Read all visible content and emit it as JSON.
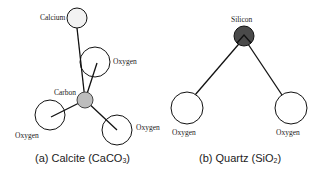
{
  "figure": {
    "panels": [
      {
        "id": "calcite",
        "caption_prefix": "(a) Calcite (CaCO",
        "caption_sub": "3",
        "caption_suffix": ")",
        "atoms": [
          {
            "label": "Calcium",
            "fill": "#f2f2f2"
          },
          {
            "label": "Oxygen",
            "fill": "#ffffff"
          },
          {
            "label": "Carbon",
            "fill": "#bdbdbd"
          },
          {
            "label": "Oxygen",
            "fill": "#ffffff"
          },
          {
            "label": "Oxygen",
            "fill": "#ffffff"
          }
        ]
      },
      {
        "id": "quartz",
        "caption_prefix": "(b) Quartz (SiO",
        "caption_sub": "2",
        "caption_suffix": ")",
        "atoms": [
          {
            "label": "Silicon",
            "fill": "#4a4a4a"
          },
          {
            "label": "Oxygen",
            "fill": "#ffffff"
          },
          {
            "label": "Oxygen",
            "fill": "#ffffff"
          }
        ]
      }
    ]
  }
}
